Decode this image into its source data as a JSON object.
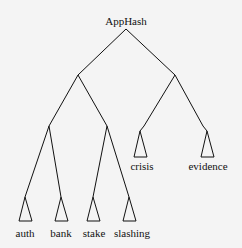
{
  "diagram": {
    "type": "tree",
    "root": {
      "label": "AppHash",
      "x": 126,
      "y": 29
    },
    "internal_nodes": [
      {
        "id": "L",
        "x": 78,
        "y": 75
      },
      {
        "id": "R",
        "x": 175,
        "y": 75
      },
      {
        "id": "LL",
        "x": 49,
        "y": 126
      },
      {
        "id": "LR",
        "x": 107,
        "y": 126
      },
      {
        "id": "RL",
        "x": 144,
        "y": 126
      },
      {
        "id": "RR",
        "x": 203,
        "y": 126
      }
    ],
    "leaves": [
      {
        "label": "auth",
        "apex_x": 25,
        "apex_y": 197,
        "label_y": 230
      },
      {
        "label": "bank",
        "apex_x": 61,
        "apex_y": 197,
        "label_y": 230
      },
      {
        "label": "stake",
        "apex_x": 93,
        "apex_y": 197,
        "label_y": 230
      },
      {
        "label": "slashing",
        "apex_x": 129,
        "apex_y": 197,
        "label_y": 230
      },
      {
        "label": "crisis",
        "apex_x": 140,
        "apex_y": 131,
        "label_y": 162
      },
      {
        "label": "evidence",
        "apex_x": 207,
        "apex_y": 131,
        "label_y": 162
      }
    ]
  }
}
